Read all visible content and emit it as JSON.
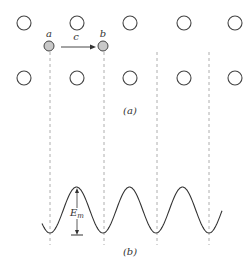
{
  "figure": {
    "part_a": {
      "caption": "(a)",
      "lattice": {
        "rows_y": [
          23,
          78
        ],
        "columns_x": [
          24,
          77,
          130,
          184,
          235
        ],
        "radius": 7,
        "stroke": "#444444",
        "fill": "#ffffff"
      },
      "atoms": [
        {
          "label": "a",
          "x": 49,
          "y": 46
        },
        {
          "label": "b",
          "x": 103,
          "y": 46
        }
      ],
      "atom_fill": "#c8c8c8",
      "jump_arrow": {
        "label": "c",
        "from": "a",
        "to": "b"
      },
      "dashed_lines_x": [
        50,
        104,
        157,
        209
      ]
    },
    "part_b": {
      "caption": "(b)",
      "curve": {
        "type": "sinusoid",
        "x_start": 42,
        "x_end": 222,
        "trough_x": [
          50,
          104,
          157,
          209
        ],
        "peak_y": 187,
        "trough_y": 233
      },
      "barrier_label": "E",
      "barrier_label_sub": "m"
    }
  }
}
